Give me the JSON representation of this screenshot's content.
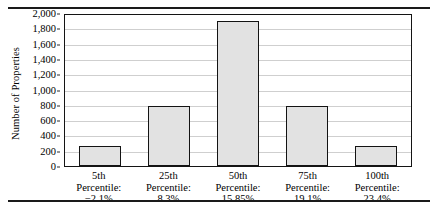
{
  "chart_data": {
    "type": "bar",
    "title": "",
    "subtitle": "",
    "xlabel": "",
    "ylabel": "Number of Properties",
    "ylim": [
      0,
      2000
    ],
    "grid": true,
    "legend": false,
    "categories": [
      "5th\nPercentile:\n−2.1%",
      "25th\nPercentile:\n8.3%",
      "50th\nPercentile:\n15.85%",
      "75th\nPercentile:\n19.1%",
      "100th\nPercentile:\n23.4%"
    ],
    "values": [
      260,
      780,
      1900,
      780,
      260
    ],
    "ytick_labels": [
      "2,000",
      "1,800",
      "1,600",
      "1,400",
      "1,200",
      "1,000",
      "800",
      "600",
      "400",
      "200",
      "0"
    ],
    "ytick_values": [
      2000,
      1800,
      1600,
      1400,
      1200,
      1000,
      800,
      600,
      400,
      200,
      0
    ]
  },
  "axis": {
    "y_title": "Number of Properties"
  },
  "categories": [
    {
      "rank": "5th",
      "word": "Percentile:",
      "percent": "−2.1%",
      "value": 260
    },
    {
      "rank": "25th",
      "word": "Percentile:",
      "percent": "8.3%",
      "value": 780
    },
    {
      "rank": "50th",
      "word": "Percentile:",
      "percent": "15.85%",
      "value": 1900
    },
    {
      "rank": "75th",
      "word": "Percentile:",
      "percent": "19.1%",
      "value": 780
    },
    {
      "rank": "100th",
      "word": "Percentile:",
      "percent": "23.4%",
      "value": 260
    }
  ],
  "colors": {
    "bar_fill": "#e2e2e2",
    "bar_edge": "#131313",
    "gridline": "#cfcfcf",
    "frame": "#141414",
    "text": "#000000"
  }
}
